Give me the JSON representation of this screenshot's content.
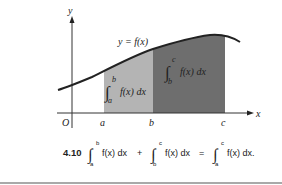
{
  "figure": {
    "number": "4.10",
    "axes": {
      "x_label": "x",
      "y_label": "y",
      "origin_label": "O",
      "tick_labels": [
        "a",
        "b",
        "c"
      ]
    },
    "curve_label": "y = f(x)",
    "regions": [
      {
        "name": "integral-a-to-b",
        "lower": "a",
        "upper": "b",
        "integrand": "f(x) dx",
        "color": "#b4b4b4"
      },
      {
        "name": "integral-b-to-c",
        "lower": "b",
        "upper": "c",
        "integrand": "f(x) dx",
        "color": "#6e6e6e"
      }
    ],
    "caption": {
      "terms": [
        {
          "lower": "a",
          "upper": "b",
          "integrand": "f(x) dx"
        },
        {
          "lower": "b",
          "upper": "c",
          "integrand": "f(x) dx"
        },
        {
          "lower": "a",
          "upper": "c",
          "integrand": "f(x) dx."
        }
      ],
      "plus": "+",
      "equals": "="
    }
  }
}
